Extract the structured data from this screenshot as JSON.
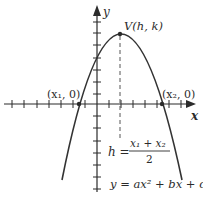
{
  "diagram": {
    "type": "parabola-graph",
    "axes": {
      "x_label": "x",
      "y_label": "y"
    },
    "labels": {
      "vertex": "V(h, k)",
      "root_left": "(x₁, 0)",
      "root_right": "(x₂, 0)",
      "h_lhs": "h =",
      "h_numerator": "x₁ + x₂",
      "h_denominator": "2",
      "equation": "y = ax² + bx + c"
    },
    "colors": {
      "curve": "#333333",
      "axis": "#2b2b2b",
      "dashed": "#555555",
      "text": "#2b2b2b"
    }
  }
}
